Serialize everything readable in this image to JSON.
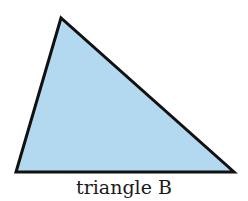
{
  "figure": {
    "label": "triangle B",
    "shape": "triangle",
    "vertices": [
      [
        61,
        18
      ],
      [
        16,
        172
      ],
      [
        234,
        172
      ]
    ],
    "fill_color": "#b3d9f0",
    "stroke_color": "#111111"
  }
}
